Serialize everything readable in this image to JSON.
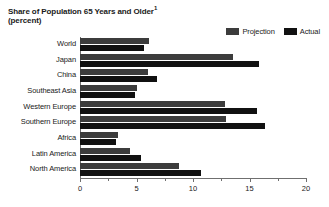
{
  "chart_data": {
    "type": "bar",
    "orientation": "horizontal",
    "title": "Share of Population 65 Years and Older",
    "title_footnote_marker": "1",
    "subtitle": "(percent)",
    "xlabel": "",
    "ylabel": "",
    "xlim": [
      0,
      20
    ],
    "xticks": [
      0,
      5,
      10,
      15,
      20
    ],
    "xtick_labels": [
      "0",
      "5",
      "10",
      "15",
      "20"
    ],
    "minor_xticks": [
      2.5,
      7.5,
      12.5,
      17.5
    ],
    "grid": false,
    "legend_position": "top-right",
    "categories": [
      "World",
      "Japan",
      "China",
      "Southeast Asia",
      "Western Europe",
      "Southern Europe",
      "Africa",
      "Latin America",
      "North America"
    ],
    "series": [
      {
        "name": "Projection",
        "color": "#3c3c3c",
        "values": [
          6.1,
          13.5,
          6.0,
          5.0,
          12.8,
          12.9,
          3.4,
          4.4,
          8.8
        ]
      },
      {
        "name": "Actual",
        "color": "#111111",
        "values": [
          5.7,
          15.8,
          6.8,
          4.9,
          15.7,
          16.4,
          3.2,
          5.4,
          10.7
        ]
      }
    ]
  },
  "colors": {
    "projection": "#3c3c3c",
    "actual": "#111111",
    "axis": "#6f6f6f",
    "text": "#1a1a1a",
    "background": "#ffffff"
  }
}
